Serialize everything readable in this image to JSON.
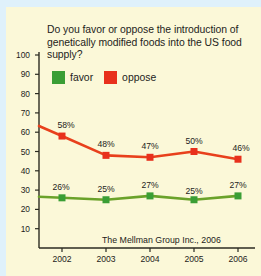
{
  "card": {
    "background": "#fbf8d8",
    "outer_background": "#dff1fb"
  },
  "chart_data": {
    "type": "line",
    "title": "Do you favor or oppose the introduction of genetically modified foods into the US food supply?",
    "xlabel": "",
    "ylabel": "",
    "categories": [
      "2002",
      "2003",
      "2004",
      "2005",
      "2006"
    ],
    "series": [
      {
        "name": "favor",
        "color": "#3a9e35",
        "line_color": "#6aa22a",
        "values": [
          26,
          25,
          27,
          25,
          27
        ],
        "labels": [
          "26%",
          "25%",
          "27%",
          "25%",
          "27%"
        ]
      },
      {
        "name": "oppose",
        "color": "#e8301c",
        "line_color": "#e8401c",
        "values": [
          58,
          48,
          47,
          50,
          46
        ],
        "labels": [
          "58%",
          "48%",
          "47%",
          "50%",
          "46%"
        ]
      }
    ],
    "ylim": [
      0,
      100
    ],
    "yticks": [
      10,
      20,
      30,
      40,
      50,
      60,
      70,
      80,
      90,
      100
    ],
    "ytick_labels": [
      "10",
      "20",
      "30",
      "40",
      "50",
      "60",
      "70",
      "80",
      "90",
      "100"
    ],
    "grid": false,
    "legend_position": "top-left",
    "source": "The Mellman Group Inc., 2006",
    "axis_color": "#2b2b22"
  },
  "legend": {
    "items": [
      {
        "label": "favor",
        "color": "#3a9e35",
        "swatch": "legend-swatch-favor"
      },
      {
        "label": "oppose",
        "color": "#e8301c",
        "swatch": "legend-swatch-oppose"
      }
    ]
  }
}
